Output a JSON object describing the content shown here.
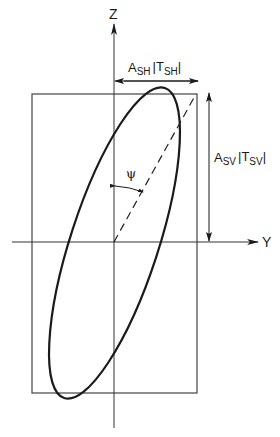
{
  "diagram": {
    "axes": {
      "z_label": "Z",
      "y_label": "Y"
    },
    "labels": {
      "horizontal_amplitude": {
        "a": "A",
        "a_sub": "SH",
        "t_open": "|T",
        "t_sub": "SH",
        "t_close": "|"
      },
      "vertical_amplitude": {
        "a": "A",
        "a_sub": "SV",
        "t_open": "|T",
        "t_sub": "SV",
        "t_close": "|"
      },
      "angle": "ψ"
    },
    "colors": {
      "stroke": "#1a1a1a",
      "thin": "#444444",
      "background": "#ffffff"
    }
  }
}
